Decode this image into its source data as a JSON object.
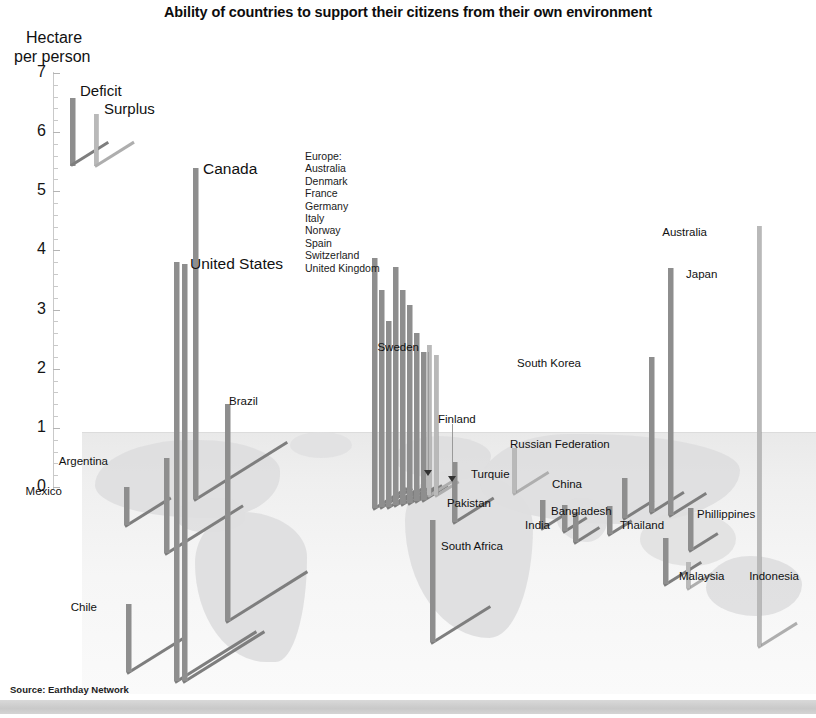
{
  "title": "Ability of countries to support their citizens from their own environment",
  "axis": {
    "title_line1": "Hectare",
    "title_line2": "per person",
    "ticks": [
      "7",
      "6",
      "5",
      "4",
      "3",
      "2",
      "1",
      "0"
    ]
  },
  "legend": {
    "deficit_label": "Deficit",
    "surplus_label": "Surplus",
    "deficit_color": "#8e8e8e",
    "surplus_color": "#b9b9b9"
  },
  "europe_group": {
    "heading": "Europe:",
    "members": [
      "Australia",
      "Denmark",
      "France",
      "Germany",
      "Italy",
      "Norway",
      "Spain",
      "Switzerland",
      "United Kingdom"
    ]
  },
  "source": "Source: Earthday Network",
  "chart_data": {
    "type": "bar",
    "title": "Ability of countries to support their citizens from their own environment",
    "xlabel": "",
    "ylabel": "Hectare per person",
    "ylim": [
      0,
      7
    ],
    "grid": false,
    "legend_position": "top-left",
    "series": [
      {
        "name": "Deficit",
        "color": "#8e8e8e"
      },
      {
        "name": "Surplus",
        "color": "#b9b9b9"
      }
    ],
    "points": [
      {
        "label": "Canada",
        "value": 5.4,
        "series": "Deficit",
        "label_size": "big"
      },
      {
        "label": "United States",
        "value": 3.8,
        "series": "Deficit",
        "label_size": "big"
      },
      {
        "label": "Brazil",
        "value": 1.4,
        "series": "Deficit",
        "label_size": "small"
      },
      {
        "label": "Argentina",
        "value": 0.3,
        "series": "Deficit",
        "label_size": "small"
      },
      {
        "label": "Mexico",
        "value": 0.1,
        "series": "Deficit",
        "label_size": "small"
      },
      {
        "label": "Chile",
        "value": 0.0,
        "series": "Deficit",
        "label_size": "small"
      },
      {
        "label": "United Kingdom",
        "value": 3.9,
        "series": "Deficit",
        "label_size": "small"
      },
      {
        "label": "Switzerland",
        "value": 3.25,
        "series": "Deficit",
        "label_size": "small"
      },
      {
        "label": "Spain",
        "value": 3.1,
        "series": "Deficit",
        "label_size": "small"
      },
      {
        "label": "Norway",
        "value": 2.8,
        "series": "Deficit",
        "label_size": "small"
      },
      {
        "label": "Italy",
        "value": 2.7,
        "series": "Deficit",
        "label_size": "small"
      },
      {
        "label": "Germany",
        "value": 2.4,
        "series": "Deficit",
        "label_size": "small"
      },
      {
        "label": "France",
        "value": 2.25,
        "series": "Deficit",
        "label_size": "small"
      },
      {
        "label": "Denmark",
        "value": 2.1,
        "series": "Deficit",
        "label_size": "small"
      },
      {
        "label": "Sweden",
        "value": 2.4,
        "series": "Surplus",
        "label_size": "small"
      },
      {
        "label": "Finland",
        "value": 2.2,
        "series": "Surplus",
        "label_size": "small"
      },
      {
        "label": "Russian Federation",
        "value": 0.55,
        "series": "Surplus",
        "label_size": "small"
      },
      {
        "label": "Turquie",
        "value": 0.45,
        "series": "Deficit",
        "label_size": "small"
      },
      {
        "label": "China",
        "value": 0.35,
        "series": "Deficit",
        "label_size": "small"
      },
      {
        "label": "Pakistan",
        "value": 0.2,
        "series": "Deficit",
        "label_size": "small"
      },
      {
        "label": "Bangladesh",
        "value": 0.2,
        "series": "Deficit",
        "label_size": "small"
      },
      {
        "label": "India",
        "value": 0.15,
        "series": "Deficit",
        "label_size": "small"
      },
      {
        "label": "Thailand",
        "value": 0.15,
        "series": "Deficit",
        "label_size": "small"
      },
      {
        "label": "South Africa",
        "value": 0.05,
        "series": "Deficit",
        "label_size": "small"
      },
      {
        "label": "Indonesia",
        "value": 0.05,
        "series": "Deficit",
        "label_size": "small"
      },
      {
        "label": "Malaysia",
        "value": 0.1,
        "series": "Surplus",
        "label_size": "small"
      },
      {
        "label": "Phillippines",
        "value": 0.2,
        "series": "Deficit",
        "label_size": "small"
      },
      {
        "label": "South Korea",
        "value": 2.1,
        "series": "Deficit",
        "label_size": "small"
      },
      {
        "label": "Japan",
        "value": 3.7,
        "series": "Deficit",
        "label_size": "small"
      },
      {
        "label": "Australia",
        "value": 4.4,
        "series": "Surplus",
        "label_size": "small"
      }
    ]
  },
  "geometry": {
    "bars": [
      {
        "name": "mexico",
        "x": 124,
        "top": 487,
        "h": 38,
        "leg": 54,
        "legdir": -32,
        "kind": "deficit"
      },
      {
        "name": "argentina",
        "x": 164,
        "top": 458,
        "h": 95,
        "leg": 92,
        "legdir": -32,
        "kind": "deficit"
      },
      {
        "name": "chile",
        "x": 126,
        "top": 604,
        "h": 68,
        "leg": 70,
        "legdir": -32,
        "kind": "deficit"
      },
      {
        "name": "canada",
        "x": 193,
        "top": 168,
        "h": 331,
        "leg": 110,
        "legdir": -32,
        "kind": "deficit"
      },
      {
        "name": "usa-a",
        "x": 174,
        "top": 262,
        "h": 419,
        "leg": 96,
        "legdir": -32,
        "kind": "deficit"
      },
      {
        "name": "usa-b",
        "x": 182,
        "top": 264,
        "h": 417,
        "leg": 96,
        "legdir": -32,
        "kind": "deficit"
      },
      {
        "name": "brazil",
        "x": 225,
        "top": 404,
        "h": 217,
        "leg": 96,
        "legdir": -32,
        "kind": "deficit"
      },
      {
        "name": "eu-uk",
        "x": 372,
        "top": 258,
        "h": 250,
        "leg": 40,
        "legdir": -32,
        "kind": "deficit"
      },
      {
        "name": "eu-1",
        "x": 379,
        "top": 290,
        "h": 217,
        "leg": 38,
        "legdir": -32,
        "kind": "deficit"
      },
      {
        "name": "eu-2",
        "x": 386,
        "top": 321,
        "h": 186,
        "leg": 36,
        "legdir": -32,
        "kind": "deficit"
      },
      {
        "name": "eu-3",
        "x": 393,
        "top": 267,
        "h": 238,
        "leg": 35,
        "legdir": -32,
        "kind": "deficit"
      },
      {
        "name": "eu-4",
        "x": 400,
        "top": 290,
        "h": 214,
        "leg": 34,
        "legdir": -32,
        "kind": "deficit"
      },
      {
        "name": "eu-5",
        "x": 407,
        "top": 305,
        "h": 198,
        "leg": 33,
        "legdir": -32,
        "kind": "deficit"
      },
      {
        "name": "eu-6",
        "x": 414,
        "top": 333,
        "h": 168,
        "leg": 32,
        "legdir": -32,
        "kind": "deficit"
      },
      {
        "name": "eu-7",
        "x": 421,
        "top": 352,
        "h": 148,
        "leg": 30,
        "legdir": -32,
        "kind": "deficit"
      },
      {
        "name": "sweden",
        "x": 427,
        "top": 345,
        "h": 150,
        "leg": 28,
        "legdir": -32,
        "kind": "surplus"
      },
      {
        "name": "finland",
        "x": 434,
        "top": 355,
        "h": 140,
        "leg": 28,
        "legdir": -32,
        "kind": "surplus"
      },
      {
        "name": "turquie",
        "x": 452,
        "top": 462,
        "h": 60,
        "leg": 48,
        "legdir": -32,
        "kind": "deficit"
      },
      {
        "name": "south-africa",
        "x": 430,
        "top": 520,
        "h": 122,
        "leg": 70,
        "legdir": -32,
        "kind": "deficit"
      },
      {
        "name": "russia",
        "x": 512,
        "top": 448,
        "h": 45,
        "leg": 42,
        "legdir": -32,
        "kind": "surplus"
      },
      {
        "name": "pakistan",
        "x": 540,
        "top": 500,
        "h": 28,
        "leg": 30,
        "legdir": -32,
        "kind": "deficit"
      },
      {
        "name": "bangladesh",
        "x": 562,
        "top": 505,
        "h": 26,
        "leg": 28,
        "legdir": -32,
        "kind": "deficit"
      },
      {
        "name": "india",
        "x": 573,
        "top": 512,
        "h": 30,
        "leg": 30,
        "legdir": -32,
        "kind": "deficit"
      },
      {
        "name": "china",
        "x": 622,
        "top": 478,
        "h": 40,
        "leg": 36,
        "legdir": -32,
        "kind": "deficit"
      },
      {
        "name": "thailand",
        "x": 607,
        "top": 506,
        "h": 28,
        "leg": 28,
        "legdir": -32,
        "kind": "deficit"
      },
      {
        "name": "indonesia",
        "x": 663,
        "top": 538,
        "h": 46,
        "leg": 44,
        "legdir": -32,
        "kind": "deficit"
      },
      {
        "name": "malaysia",
        "x": 686,
        "top": 562,
        "h": 26,
        "leg": 30,
        "legdir": -32,
        "kind": "surplus"
      },
      {
        "name": "phillippines",
        "x": 688,
        "top": 508,
        "h": 42,
        "leg": 34,
        "legdir": -32,
        "kind": "deficit"
      },
      {
        "name": "south-korea",
        "x": 649,
        "top": 357,
        "h": 155,
        "leg": 40,
        "legdir": -32,
        "kind": "deficit"
      },
      {
        "name": "japan",
        "x": 668,
        "top": 268,
        "h": 247,
        "leg": 44,
        "legdir": -32,
        "kind": "deficit"
      },
      {
        "name": "australia",
        "x": 757,
        "top": 226,
        "h": 420,
        "leg": 46,
        "legdir": -32,
        "kind": "surplus"
      }
    ],
    "labels": [
      {
        "name": "canada",
        "x": 203,
        "y": 160,
        "size": "big"
      },
      {
        "name": "united-states",
        "x": 190,
        "y": 255,
        "size": "big"
      },
      {
        "name": "brazil",
        "x": 229,
        "y": 395,
        "size": "small"
      },
      {
        "name": "argentina",
        "x": 108,
        "y": 455,
        "size": "small"
      },
      {
        "name": "mexico",
        "x": 62,
        "y": 485,
        "size": "small"
      },
      {
        "name": "chile",
        "x": 97,
        "y": 601,
        "size": "small"
      },
      {
        "name": "sweden",
        "x": 419,
        "y": 341,
        "size": "small"
      },
      {
        "name": "finland",
        "x": 438,
        "y": 413,
        "size": "small"
      },
      {
        "name": "russian-federation",
        "x": 510,
        "y": 438,
        "size": "small"
      },
      {
        "name": "turquie",
        "x": 471,
        "y": 468,
        "size": "small"
      },
      {
        "name": "china",
        "x": 582,
        "y": 478,
        "size": "small"
      },
      {
        "name": "pakistan",
        "x": 491,
        "y": 497,
        "size": "small"
      },
      {
        "name": "bangladesh",
        "x": 551,
        "y": 505,
        "size": "small"
      },
      {
        "name": "india",
        "x": 550,
        "y": 519,
        "size": "small"
      },
      {
        "name": "thailand",
        "x": 620,
        "y": 519,
        "size": "small"
      },
      {
        "name": "south-africa",
        "x": 441,
        "y": 540,
        "size": "small"
      },
      {
        "name": "indonesia",
        "x": 799,
        "y": 570,
        "size": "small"
      },
      {
        "name": "malaysia",
        "x": 679,
        "y": 570,
        "size": "small"
      },
      {
        "name": "phillippines",
        "x": 697,
        "y": 508,
        "size": "small"
      },
      {
        "name": "south-korea",
        "x": 581,
        "y": 357,
        "size": "small"
      },
      {
        "name": "japan",
        "x": 686,
        "y": 268,
        "size": "small"
      },
      {
        "name": "australia",
        "x": 707,
        "y": 226,
        "size": "small"
      }
    ],
    "land": [
      {
        "name": "north-america",
        "x": 95,
        "y": 440,
        "w": 185,
        "h": 78,
        "r": "52% 44% 36% 60%/58% 40% 56% 42%",
        "op": 0.95
      },
      {
        "name": "central-america",
        "x": 175,
        "y": 498,
        "w": 70,
        "h": 34,
        "r": "60% 30% 50% 40%/50% 60% 40% 50%",
        "op": 0.85
      },
      {
        "name": "south-america",
        "x": 195,
        "y": 512,
        "w": 112,
        "h": 150,
        "r": "42% 58% 28% 64%/34% 30% 70% 66%",
        "op": 0.95
      },
      {
        "name": "greenland",
        "x": 290,
        "y": 432,
        "w": 62,
        "h": 26,
        "r": "50%",
        "op": 0.7
      },
      {
        "name": "europe",
        "x": 395,
        "y": 436,
        "w": 96,
        "h": 44,
        "r": "46% 54% 40% 60%/52% 46% 54% 48%",
        "op": 0.9
      },
      {
        "name": "africa",
        "x": 405,
        "y": 470,
        "w": 128,
        "h": 168,
        "r": "40% 60% 34% 66%/30% 34% 66% 70%",
        "op": 0.95
      },
      {
        "name": "asia",
        "x": 480,
        "y": 434,
        "w": 260,
        "h": 90,
        "r": "34% 60% 46% 54%/56% 40% 60% 44%",
        "op": 0.95
      },
      {
        "name": "india-sub",
        "x": 556,
        "y": 498,
        "w": 52,
        "h": 44,
        "r": "50% 50% 40% 60%/40% 44% 56% 60%",
        "op": 0.85
      },
      {
        "name": "se-asia",
        "x": 640,
        "y": 512,
        "w": 96,
        "h": 54,
        "r": "48% 52% 46% 54%/50% 50% 50% 50%",
        "op": 0.8
      },
      {
        "name": "australia",
        "x": 706,
        "y": 556,
        "w": 96,
        "h": 60,
        "r": "46% 54% 48% 52%/52% 48% 52% 48%",
        "op": 0.9
      }
    ]
  }
}
